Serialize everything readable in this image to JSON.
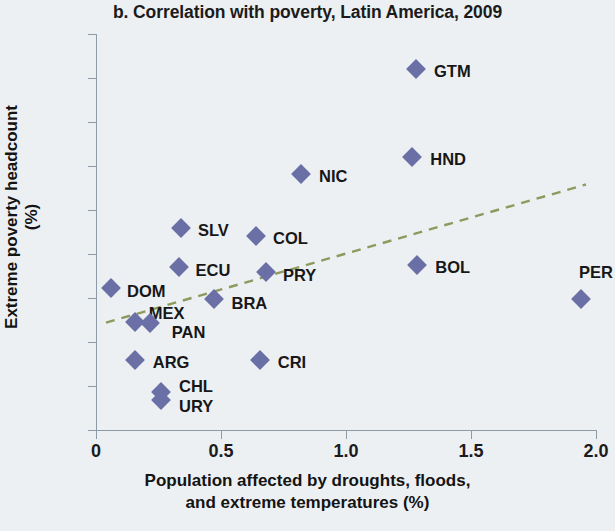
{
  "chart_data": {
    "type": "scatter",
    "title": "b. Correlation with poverty, Latin America, 2009",
    "xlabel": "Population affected by droughts, floods, and extreme temperatures (%)",
    "xlabel_line1": "Population affected by droughts, floods,",
    "xlabel_line2": "and extreme temperatures (%)",
    "ylabel": "Extreme poverty headcount (%)",
    "xlim": [
      0,
      2.0
    ],
    "ylim": [
      0,
      45
    ],
    "xticks": [
      "0",
      "0.5",
      "1.0",
      "1.5",
      "2.0"
    ],
    "xtick_values": [
      0,
      0.5,
      1.0,
      1.5,
      2.0
    ],
    "yticks": [
      "0",
      "5",
      "10",
      "15",
      "20",
      "25",
      "30",
      "35",
      "40",
      "45"
    ],
    "ytick_values": [
      0,
      5,
      10,
      15,
      20,
      25,
      30,
      35,
      40,
      45
    ],
    "grid": false,
    "legend": false,
    "marker_color": "#6a70a6",
    "marker_shape": "diamond",
    "trendline": {
      "style": "dashed",
      "color": "#8d9a5e",
      "x_start": 0.04,
      "y_start": 12.2,
      "x_end": 1.96,
      "y_end": 27.9
    },
    "points": [
      {
        "label": "DOM",
        "x": 0.06,
        "y": 16.1,
        "label_dx": 16,
        "label_dy": 4
      },
      {
        "label": "MEX",
        "x": 0.155,
        "y": 12.3,
        "label_dx": 14,
        "label_dy": -8
      },
      {
        "label": "PAN",
        "x": 0.215,
        "y": 12.2,
        "label_dx": 22,
        "label_dy": 10
      },
      {
        "label": "ARG",
        "x": 0.155,
        "y": 8.0,
        "label_dx": 18,
        "label_dy": 3
      },
      {
        "label": "CHL",
        "x": 0.26,
        "y": 4.3,
        "label_dx": 18,
        "label_dy": -5
      },
      {
        "label": "URY",
        "x": 0.26,
        "y": 3.4,
        "label_dx": 18,
        "label_dy": 7
      },
      {
        "label": "SLV",
        "x": 0.34,
        "y": 23.0,
        "label_dx": 17,
        "label_dy": 3
      },
      {
        "label": "ECU",
        "x": 0.33,
        "y": 18.5,
        "label_dx": 17,
        "label_dy": 4
      },
      {
        "label": "BRA",
        "x": 0.47,
        "y": 14.9,
        "label_dx": 18,
        "label_dy": 5
      },
      {
        "label": "COL",
        "x": 0.64,
        "y": 22.0,
        "label_dx": 17,
        "label_dy": 3
      },
      {
        "label": "PRY",
        "x": 0.68,
        "y": 17.9,
        "label_dx": 17,
        "label_dy": 4
      },
      {
        "label": "CRI",
        "x": 0.655,
        "y": 8.0,
        "label_dx": 18,
        "label_dy": 3
      },
      {
        "label": "NIC",
        "x": 0.82,
        "y": 29.1,
        "label_dx": 18,
        "label_dy": 3
      },
      {
        "label": "GTM",
        "x": 1.28,
        "y": 41.0,
        "label_dx": 18,
        "label_dy": 3
      },
      {
        "label": "HND",
        "x": 1.265,
        "y": 31.0,
        "label_dx": 18,
        "label_dy": 3
      },
      {
        "label": "BOL",
        "x": 1.285,
        "y": 18.8,
        "label_dx": 18,
        "label_dy": 3
      },
      {
        "label": "PER",
        "x": 1.94,
        "y": 14.9,
        "label_dx": -2,
        "label_dy": -26
      }
    ]
  }
}
